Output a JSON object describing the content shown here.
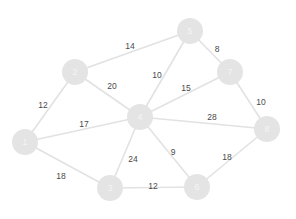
{
  "chart_data": {
    "type": "diagram",
    "title": "",
    "graph_type": "weighted-undirected-graph",
    "background_color": "#ffffff",
    "node_color": "#e4e4e4",
    "node_label_color": "#f4f4f4",
    "edge_color": "#e2e2e2",
    "weight_label_color": "#4a4a4a",
    "node_radius": 13,
    "nodes": [
      {
        "id": "1",
        "label": "1",
        "x": 25,
        "y": 142
      },
      {
        "id": "2",
        "label": "2",
        "x": 75,
        "y": 72
      },
      {
        "id": "3",
        "label": "3",
        "x": 110,
        "y": 188
      },
      {
        "id": "4",
        "label": "4",
        "x": 140,
        "y": 117
      },
      {
        "id": "5",
        "label": "5",
        "x": 190,
        "y": 31
      },
      {
        "id": "6",
        "label": "6",
        "x": 197,
        "y": 187
      },
      {
        "id": "7",
        "label": "7",
        "x": 230,
        "y": 72
      },
      {
        "id": "8",
        "label": "8",
        "x": 267,
        "y": 129
      }
    ],
    "edges": [
      {
        "source": "2",
        "target": "5",
        "weight": 14,
        "label": "14",
        "lx": 130,
        "ly": 46
      },
      {
        "source": "5",
        "target": "7",
        "weight": 8,
        "label": "8",
        "lx": 217,
        "ly": 49
      },
      {
        "source": "4",
        "target": "5",
        "weight": 10,
        "label": "10",
        "lx": 157,
        "ly": 75
      },
      {
        "source": "4",
        "target": "7",
        "weight": 15,
        "label": "15",
        "lx": 186,
        "ly": 88
      },
      {
        "source": "1",
        "target": "2",
        "weight": 12,
        "label": "12",
        "lx": 43,
        "ly": 105
      },
      {
        "source": "2",
        "target": "4",
        "weight": 20,
        "label": "20",
        "lx": 112,
        "ly": 86
      },
      {
        "source": "1",
        "target": "4",
        "weight": 17,
        "label": "17",
        "lx": 84,
        "ly": 124
      },
      {
        "source": "7",
        "target": "8",
        "weight": 10,
        "label": "10",
        "lx": 261,
        "ly": 102
      },
      {
        "source": "4",
        "target": "8",
        "weight": 28,
        "label": "28",
        "lx": 212,
        "ly": 117
      },
      {
        "source": "3",
        "target": "4",
        "weight": 24,
        "label": "24",
        "lx": 133,
        "ly": 159
      },
      {
        "source": "4",
        "target": "6",
        "weight": 9,
        "label": "9",
        "lx": 173,
        "ly": 152
      },
      {
        "source": "1",
        "target": "3",
        "weight": 18,
        "label": "18",
        "lx": 61,
        "ly": 176
      },
      {
        "source": "3",
        "target": "6",
        "weight": 12,
        "label": "12",
        "lx": 153,
        "ly": 186
      },
      {
        "source": "6",
        "target": "8",
        "weight": 18,
        "label": "18",
        "lx": 227,
        "ly": 157
      }
    ],
    "xlim": [
      0,
      296
    ],
    "ylim": [
      0,
      219
    ],
    "legend": null,
    "grid": false
  }
}
